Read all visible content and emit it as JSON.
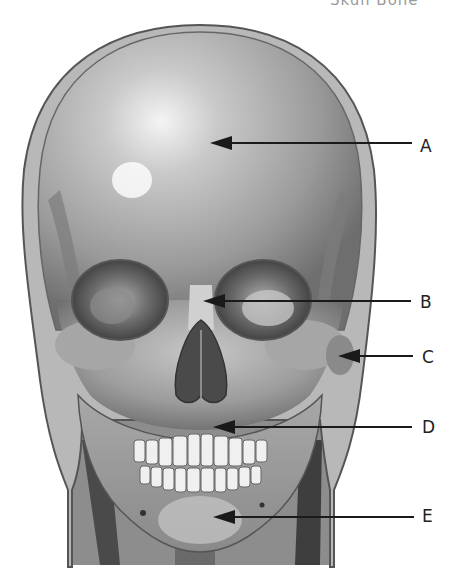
{
  "figure": {
    "title_fragment": "Skull Bone",
    "background": "#ffffff",
    "ink_color": "#1a1a1a"
  },
  "labels": [
    {
      "id": "A",
      "text": "A",
      "tip": [
        212,
        143
      ],
      "line_end": 412,
      "label_pos": [
        420,
        138
      ]
    },
    {
      "id": "B",
      "text": "B",
      "tip": [
        205,
        301
      ],
      "line_end": 411,
      "label_pos": [
        420,
        294
      ]
    },
    {
      "id": "C",
      "text": "C",
      "tip": [
        340,
        356
      ],
      "line_end": 413,
      "label_pos": [
        422,
        349
      ]
    },
    {
      "id": "D",
      "text": "D",
      "tip": [
        215,
        427
      ],
      "line_end": 412,
      "label_pos": [
        422,
        419
      ]
    },
    {
      "id": "E",
      "text": "E",
      "tip": [
        215,
        517
      ],
      "line_end": 414,
      "label_pos": [
        422,
        508
      ]
    }
  ]
}
